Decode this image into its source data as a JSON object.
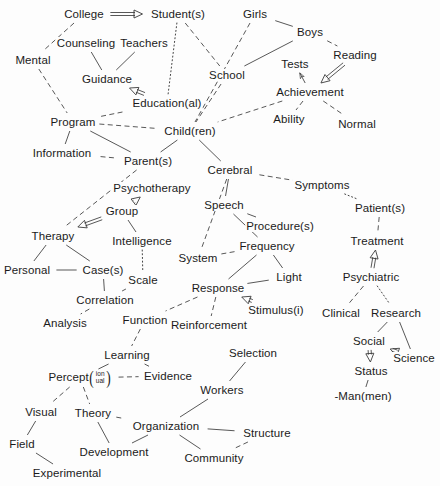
{
  "diagram": {
    "background_color": "#fdfdfd",
    "line_color": "#3a3a3a",
    "text_color": "#1b1b1b",
    "nodes": [
      {
        "id": "college",
        "label": "College",
        "x": 84,
        "y": 14
      },
      {
        "id": "students",
        "label": "Student(s)",
        "x": 178,
        "y": 14
      },
      {
        "id": "girls",
        "label": "Girls",
        "x": 255,
        "y": 14
      },
      {
        "id": "boys",
        "label": "Boys",
        "x": 310,
        "y": 32
      },
      {
        "id": "counseling",
        "label": "Counseling",
        "x": 86,
        "y": 43
      },
      {
        "id": "teachers",
        "label": "Teachers",
        "x": 144,
        "y": 43
      },
      {
        "id": "reading",
        "label": "Reading",
        "x": 355,
        "y": 55
      },
      {
        "id": "mental",
        "label": "Mental",
        "x": 33,
        "y": 60
      },
      {
        "id": "guidance",
        "label": "Guidance",
        "x": 107,
        "y": 79
      },
      {
        "id": "school",
        "label": "School",
        "x": 227,
        "y": 75
      },
      {
        "id": "tests",
        "label": "Tests",
        "x": 295,
        "y": 64
      },
      {
        "id": "achievement",
        "label": "Achievement",
        "x": 310,
        "y": 92
      },
      {
        "id": "educational",
        "label": "Education(al)",
        "x": 167,
        "y": 103
      },
      {
        "id": "ability",
        "label": "Ability",
        "x": 289,
        "y": 119
      },
      {
        "id": "normal",
        "label": "Normal",
        "x": 357,
        "y": 124
      },
      {
        "id": "program",
        "label": "Program",
        "x": 73,
        "y": 122
      },
      {
        "id": "children",
        "label": "Child(ren)",
        "x": 190,
        "y": 131
      },
      {
        "id": "information",
        "label": "Information",
        "x": 62,
        "y": 153
      },
      {
        "id": "parents",
        "label": "Parent(s)",
        "x": 148,
        "y": 161
      },
      {
        "id": "cerebral",
        "label": "Cerebral",
        "x": 230,
        "y": 170
      },
      {
        "id": "psychotherapy",
        "label": "Psychotherapy",
        "x": 152,
        "y": 188
      },
      {
        "id": "symptoms",
        "label": "Symptoms",
        "x": 322,
        "y": 185
      },
      {
        "id": "speech",
        "label": "Speech",
        "x": 224,
        "y": 205
      },
      {
        "id": "group",
        "label": "Group",
        "x": 122,
        "y": 211
      },
      {
        "id": "procedures",
        "label": "Procedure(s)",
        "x": 280,
        "y": 226
      },
      {
        "id": "patients",
        "label": "Patient(s)",
        "x": 380,
        "y": 208
      },
      {
        "id": "therapy",
        "label": "Therapy",
        "x": 53,
        "y": 236
      },
      {
        "id": "intelligence",
        "label": "Intelligence",
        "x": 142,
        "y": 241
      },
      {
        "id": "frequency",
        "label": "Frequency",
        "x": 267,
        "y": 246
      },
      {
        "id": "treatment",
        "label": "Treatment",
        "x": 377,
        "y": 241
      },
      {
        "id": "system",
        "label": "System",
        "x": 198,
        "y": 258
      },
      {
        "id": "personal",
        "label": "Personal",
        "x": 27,
        "y": 270
      },
      {
        "id": "cases",
        "label": "Case(s)",
        "x": 103,
        "y": 270
      },
      {
        "id": "light",
        "label": "Light",
        "x": 289,
        "y": 277
      },
      {
        "id": "scale",
        "label": "Scale",
        "x": 143,
        "y": 280
      },
      {
        "id": "psychiatric",
        "label": "Psychiatric",
        "x": 371,
        "y": 277
      },
      {
        "id": "response",
        "label": "Response",
        "x": 218,
        "y": 288
      },
      {
        "id": "correlation",
        "label": "Correlation",
        "x": 105,
        "y": 300
      },
      {
        "id": "clinical",
        "label": "Clinical",
        "x": 341,
        "y": 313
      },
      {
        "id": "research",
        "label": "Research",
        "x": 396,
        "y": 313
      },
      {
        "id": "stimulus",
        "label": "Stimulus(i)",
        "x": 276,
        "y": 310
      },
      {
        "id": "analysis",
        "label": "Analysis",
        "x": 65,
        "y": 323
      },
      {
        "id": "function",
        "label": "Function",
        "x": 145,
        "y": 320
      },
      {
        "id": "reinforcement",
        "label": "Reinforcement",
        "x": 209,
        "y": 325
      },
      {
        "id": "social",
        "label": "Social",
        "x": 369,
        "y": 341
      },
      {
        "id": "selection",
        "label": "Selection",
        "x": 253,
        "y": 353
      },
      {
        "id": "learning",
        "label": "Learning",
        "x": 127,
        "y": 355
      },
      {
        "id": "science",
        "label": "Science",
        "x": 414,
        "y": 358
      },
      {
        "id": "status",
        "label": "Status",
        "x": 371,
        "y": 371
      },
      {
        "id": "evidence",
        "label": "Evidence",
        "x": 168,
        "y": 376
      },
      {
        "id": "percept",
        "label": "Percept",
        "x": 80,
        "y": 378,
        "sub_top": "ion",
        "sub_bottom": "ual",
        "compound": true
      },
      {
        "id": "workers",
        "label": "Workers",
        "x": 222,
        "y": 390
      },
      {
        "id": "visual",
        "label": "Visual",
        "x": 41,
        "y": 412
      },
      {
        "id": "theory",
        "label": "Theory",
        "x": 93,
        "y": 413
      },
      {
        "id": "manmen",
        "label": "-Man(men)",
        "x": 363,
        "y": 396
      },
      {
        "id": "organization",
        "label": "Organization",
        "x": 166,
        "y": 426
      },
      {
        "id": "structure",
        "label": "Structure",
        "x": 267,
        "y": 433
      },
      {
        "id": "field",
        "label": "Field",
        "x": 22,
        "y": 444
      },
      {
        "id": "development",
        "label": "Development",
        "x": 114,
        "y": 452
      },
      {
        "id": "community",
        "label": "Community",
        "x": 214,
        "y": 458
      },
      {
        "id": "experimental",
        "label": "Experimental",
        "x": 67,
        "y": 473
      }
    ],
    "edges": [
      {
        "from": "college",
        "to": "students",
        "style": "double-arrow"
      },
      {
        "from": "college",
        "to": "mental",
        "style": "dashed"
      },
      {
        "from": "students",
        "to": "educational",
        "style": "dotted"
      },
      {
        "from": "students",
        "to": "school",
        "style": "dashed"
      },
      {
        "from": "girls",
        "to": "boys",
        "style": "solid"
      },
      {
        "from": "girls",
        "to": "children",
        "style": "dashed"
      },
      {
        "from": "boys",
        "to": "school",
        "style": "solid"
      },
      {
        "from": "boys",
        "to": "reading",
        "style": "dashed"
      },
      {
        "from": "reading",
        "to": "achievement",
        "style": "double-arrow"
      },
      {
        "from": "counseling",
        "to": "guidance",
        "style": "solid"
      },
      {
        "from": "teachers",
        "to": "guidance",
        "style": "solid"
      },
      {
        "from": "mental",
        "to": "program",
        "style": "dashed"
      },
      {
        "from": "educational",
        "to": "guidance",
        "style": "double-arrow"
      },
      {
        "from": "educational",
        "to": "program",
        "style": "dashed"
      },
      {
        "from": "school",
        "to": "children",
        "style": "dashed"
      },
      {
        "from": "achievement",
        "to": "tests",
        "style": "arrow"
      },
      {
        "from": "achievement",
        "to": "children",
        "style": "dashed"
      },
      {
        "from": "achievement",
        "to": "ability",
        "style": "dashed"
      },
      {
        "from": "achievement",
        "to": "normal",
        "style": "dashed"
      },
      {
        "from": "program",
        "to": "children",
        "style": "dashed"
      },
      {
        "from": "program",
        "to": "information",
        "style": "solid"
      },
      {
        "from": "program",
        "to": "parents",
        "style": "solid"
      },
      {
        "from": "information",
        "to": "parents",
        "style": "dashed"
      },
      {
        "from": "children",
        "to": "parents",
        "style": "solid"
      },
      {
        "from": "children",
        "to": "cerebral",
        "style": "solid"
      },
      {
        "from": "parents",
        "to": "therapy",
        "style": "dashed"
      },
      {
        "from": "cerebral",
        "to": "symptoms",
        "style": "dashed"
      },
      {
        "from": "cerebral",
        "to": "speech",
        "style": "solid"
      },
      {
        "from": "cerebral",
        "to": "system",
        "style": "dashed"
      },
      {
        "from": "symptoms",
        "to": "patients",
        "style": "dotted"
      },
      {
        "from": "speech",
        "to": "procedures",
        "style": "solid"
      },
      {
        "from": "speech",
        "to": "frequency",
        "style": "solid"
      },
      {
        "from": "group",
        "to": "psychotherapy",
        "style": "double-arrow"
      },
      {
        "from": "group",
        "to": "therapy",
        "style": "double-arrow"
      },
      {
        "from": "group",
        "to": "intelligence",
        "style": "solid"
      },
      {
        "from": "patients",
        "to": "treatment",
        "style": "dashed"
      },
      {
        "from": "therapy",
        "to": "personal",
        "style": "solid"
      },
      {
        "from": "therapy",
        "to": "cases",
        "style": "solid"
      },
      {
        "from": "intelligence",
        "to": "scale",
        "style": "dotted"
      },
      {
        "from": "frequency",
        "to": "system",
        "style": "dashed"
      },
      {
        "from": "frequency",
        "to": "response",
        "style": "solid"
      },
      {
        "from": "frequency",
        "to": "light",
        "style": "solid"
      },
      {
        "from": "psychiatric",
        "to": "treatment",
        "style": "double-arrow"
      },
      {
        "from": "psychiatric",
        "to": "clinical",
        "style": "dashed"
      },
      {
        "from": "psychiatric",
        "to": "research",
        "style": "dotted"
      },
      {
        "from": "personal",
        "to": "cases",
        "style": "solid"
      },
      {
        "from": "cases",
        "to": "correlation",
        "style": "solid"
      },
      {
        "from": "scale",
        "to": "correlation",
        "style": "solid"
      },
      {
        "from": "light",
        "to": "response",
        "style": "solid"
      },
      {
        "from": "response",
        "to": "function",
        "style": "dashed"
      },
      {
        "from": "response",
        "to": "reinforcement",
        "style": "dashed"
      },
      {
        "from": "stimulus",
        "to": "response",
        "style": "double-arrow"
      },
      {
        "from": "correlation",
        "to": "analysis",
        "style": "dashed"
      },
      {
        "from": "research",
        "to": "social",
        "style": "solid"
      },
      {
        "from": "research",
        "to": "science",
        "style": "solid"
      },
      {
        "from": "function",
        "to": "learning",
        "style": "dashed"
      },
      {
        "from": "social",
        "to": "status",
        "style": "double-arrow"
      },
      {
        "from": "social",
        "to": "science",
        "style": "double-arrow"
      },
      {
        "from": "selection",
        "to": "workers",
        "style": "solid"
      },
      {
        "from": "learning",
        "to": "percept",
        "style": "solid"
      },
      {
        "from": "learning",
        "to": "evidence",
        "style": "dashed"
      },
      {
        "from": "status",
        "to": "manmen",
        "style": "solid"
      },
      {
        "from": "percept",
        "to": "evidence",
        "style": "dashed"
      },
      {
        "from": "percept",
        "to": "visual",
        "style": "dashed"
      },
      {
        "from": "percept",
        "to": "theory",
        "style": "dashed"
      },
      {
        "from": "workers",
        "to": "organization",
        "style": "solid"
      },
      {
        "from": "visual",
        "to": "field",
        "style": "solid"
      },
      {
        "from": "theory",
        "to": "organization",
        "style": "dashed"
      },
      {
        "from": "theory",
        "to": "development",
        "style": "solid"
      },
      {
        "from": "organization",
        "to": "structure",
        "style": "solid"
      },
      {
        "from": "organization",
        "to": "development",
        "style": "solid"
      },
      {
        "from": "organization",
        "to": "community",
        "style": "solid"
      },
      {
        "from": "structure",
        "to": "community",
        "style": "dashed"
      },
      {
        "from": "field",
        "to": "experimental",
        "style": "solid"
      }
    ]
  }
}
